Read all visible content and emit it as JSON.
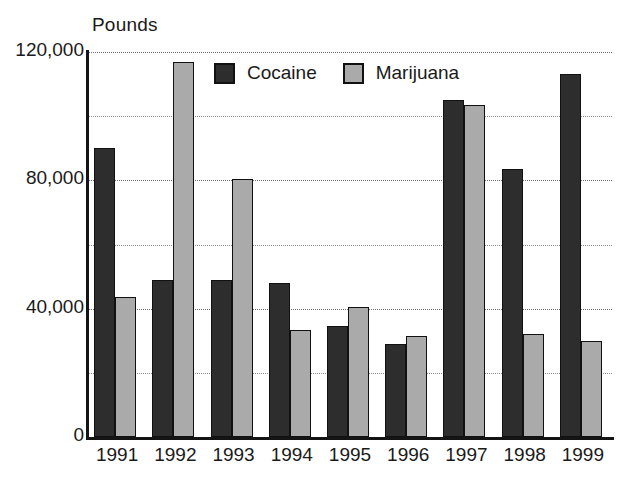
{
  "chart_data": {
    "type": "bar",
    "title": "",
    "subtitle": "",
    "xlabel": "",
    "ylabel": "Pounds",
    "ylim": [
      0,
      120000
    ],
    "ytick_values": [
      0,
      40000,
      80000,
      120000
    ],
    "ytick_labels": [
      "0",
      "40,000",
      "80,000",
      "120,000"
    ],
    "minor_gridlines": [
      20000,
      60000,
      100000
    ],
    "grid": true,
    "legend_position": "top-center-inside",
    "categories": [
      "1991",
      "1992",
      "1993",
      "1994",
      "1995",
      "1996",
      "1997",
      "1998",
      "1999"
    ],
    "series": [
      {
        "name": "Cocaine",
        "color": "#2d2d2d",
        "values": [
          90000,
          49000,
          49000,
          48000,
          34500,
          29000,
          105000,
          83500,
          113000
        ]
      },
      {
        "name": "Marijuana",
        "color": "#aaaaaa",
        "values": [
          43500,
          117000,
          80500,
          33500,
          40500,
          31500,
          103500,
          32000,
          30000
        ]
      }
    ]
  },
  "axis": {
    "unit_caption": "Pounds",
    "axis_color": "#141414",
    "gridline_color": "#8e8e8e"
  },
  "legend": {
    "items": [
      {
        "label": "Cocaine",
        "swatch": "cocaine"
      },
      {
        "label": "Marijuana",
        "swatch": "marijuana"
      }
    ]
  }
}
